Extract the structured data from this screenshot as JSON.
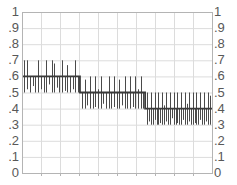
{
  "chart_data": {
    "type": "line",
    "title": "",
    "subtitle": "",
    "xlabel": "",
    "ylabel": "",
    "grid": true,
    "legend": null,
    "ylim": [
      0,
      1
    ],
    "xlim": [
      0,
      1
    ],
    "y_tick_labels": [
      "1",
      ".9",
      ".8",
      ".7",
      ".6",
      ".5",
      ".4",
      ".3",
      ".2",
      ".1",
      "0"
    ],
    "y_tick_values": [
      1,
      0.9,
      0.8,
      0.7,
      0.6,
      0.5,
      0.4,
      0.3,
      0.2,
      0.1,
      0
    ],
    "y_axis_right_tick_labels": [
      "1",
      ".9",
      ".8",
      ".7",
      ".6",
      ".5",
      ".4",
      ".3",
      ".2",
      ".1",
      "0"
    ],
    "x_tick_labels": [],
    "x_gridline_count": 9,
    "series": [
      {
        "name": "step-baseline",
        "type": "step",
        "color": "#3a3a3a",
        "segments": [
          {
            "x_start": 0.0,
            "x_end": 0.305,
            "value": 0.6
          },
          {
            "x_start": 0.305,
            "x_end": 0.648,
            "value": 0.5
          },
          {
            "x_start": 0.648,
            "x_end": 1.0,
            "value": 0.4
          }
        ]
      },
      {
        "name": "noise-spikes",
        "type": "vertical-lines",
        "color": "#4a4a4a",
        "description": "Vertical spike lines deviating about the step baseline by plus or minus 0.1",
        "spikes": [
          {
            "x": 0.012,
            "low": 0.5,
            "high": 0.7
          },
          {
            "x": 0.028,
            "low": 0.52,
            "high": 0.7
          },
          {
            "x": 0.04,
            "low": 0.5,
            "high": 0.6
          },
          {
            "x": 0.056,
            "low": 0.54,
            "high": 0.6
          },
          {
            "x": 0.07,
            "low": 0.5,
            "high": 0.6
          },
          {
            "x": 0.086,
            "low": 0.5,
            "high": 0.7
          },
          {
            "x": 0.1,
            "low": 0.52,
            "high": 0.6
          },
          {
            "x": 0.114,
            "low": 0.5,
            "high": 0.6
          },
          {
            "x": 0.128,
            "low": 0.5,
            "high": 0.7
          },
          {
            "x": 0.142,
            "low": 0.55,
            "high": 0.6
          },
          {
            "x": 0.156,
            "low": 0.5,
            "high": 0.7
          },
          {
            "x": 0.168,
            "low": 0.5,
            "high": 0.68
          },
          {
            "x": 0.182,
            "low": 0.53,
            "high": 0.6
          },
          {
            "x": 0.196,
            "low": 0.5,
            "high": 0.6
          },
          {
            "x": 0.21,
            "low": 0.5,
            "high": 0.7
          },
          {
            "x": 0.224,
            "low": 0.51,
            "high": 0.6
          },
          {
            "x": 0.238,
            "low": 0.5,
            "high": 0.67
          },
          {
            "x": 0.252,
            "low": 0.5,
            "high": 0.6
          },
          {
            "x": 0.266,
            "low": 0.52,
            "high": 0.6
          },
          {
            "x": 0.28,
            "low": 0.5,
            "high": 0.7
          },
          {
            "x": 0.294,
            "low": 0.5,
            "high": 0.6
          },
          {
            "x": 0.316,
            "low": 0.4,
            "high": 0.5
          },
          {
            "x": 0.33,
            "low": 0.4,
            "high": 0.58
          },
          {
            "x": 0.344,
            "low": 0.42,
            "high": 0.5
          },
          {
            "x": 0.358,
            "low": 0.4,
            "high": 0.6
          },
          {
            "x": 0.372,
            "low": 0.4,
            "high": 0.5
          },
          {
            "x": 0.386,
            "low": 0.41,
            "high": 0.6
          },
          {
            "x": 0.4,
            "low": 0.4,
            "high": 0.52
          },
          {
            "x": 0.414,
            "low": 0.4,
            "high": 0.6
          },
          {
            "x": 0.428,
            "low": 0.43,
            "high": 0.5
          },
          {
            "x": 0.442,
            "low": 0.4,
            "high": 0.5
          },
          {
            "x": 0.456,
            "low": 0.4,
            "high": 0.6
          },
          {
            "x": 0.47,
            "low": 0.4,
            "high": 0.5
          },
          {
            "x": 0.484,
            "low": 0.41,
            "high": 0.6
          },
          {
            "x": 0.498,
            "low": 0.4,
            "high": 0.5
          },
          {
            "x": 0.512,
            "low": 0.4,
            "high": 0.58
          },
          {
            "x": 0.526,
            "low": 0.42,
            "high": 0.5
          },
          {
            "x": 0.54,
            "low": 0.4,
            "high": 0.6
          },
          {
            "x": 0.554,
            "low": 0.4,
            "high": 0.5
          },
          {
            "x": 0.568,
            "low": 0.4,
            "high": 0.6
          },
          {
            "x": 0.582,
            "low": 0.41,
            "high": 0.5
          },
          {
            "x": 0.596,
            "low": 0.4,
            "high": 0.6
          },
          {
            "x": 0.61,
            "low": 0.4,
            "high": 0.52
          },
          {
            "x": 0.624,
            "low": 0.4,
            "high": 0.6
          },
          {
            "x": 0.638,
            "low": 0.4,
            "high": 0.5
          },
          {
            "x": 0.658,
            "low": 0.3,
            "high": 0.5
          },
          {
            "x": 0.668,
            "low": 0.32,
            "high": 0.4
          },
          {
            "x": 0.678,
            "low": 0.3,
            "high": 0.5
          },
          {
            "x": 0.688,
            "low": 0.3,
            "high": 0.4
          },
          {
            "x": 0.698,
            "low": 0.33,
            "high": 0.5
          },
          {
            "x": 0.708,
            "low": 0.3,
            "high": 0.4
          },
          {
            "x": 0.718,
            "low": 0.3,
            "high": 0.5
          },
          {
            "x": 0.728,
            "low": 0.31,
            "high": 0.4
          },
          {
            "x": 0.738,
            "low": 0.3,
            "high": 0.5
          },
          {
            "x": 0.748,
            "low": 0.3,
            "high": 0.42
          },
          {
            "x": 0.758,
            "low": 0.32,
            "high": 0.5
          },
          {
            "x": 0.768,
            "low": 0.3,
            "high": 0.4
          },
          {
            "x": 0.778,
            "low": 0.3,
            "high": 0.5
          },
          {
            "x": 0.788,
            "low": 0.34,
            "high": 0.4
          },
          {
            "x": 0.798,
            "low": 0.3,
            "high": 0.5
          },
          {
            "x": 0.808,
            "low": 0.3,
            "high": 0.4
          },
          {
            "x": 0.818,
            "low": 0.31,
            "high": 0.5
          },
          {
            "x": 0.828,
            "low": 0.3,
            "high": 0.4
          },
          {
            "x": 0.838,
            "low": 0.3,
            "high": 0.5
          },
          {
            "x": 0.848,
            "low": 0.33,
            "high": 0.4
          },
          {
            "x": 0.858,
            "low": 0.3,
            "high": 0.5
          },
          {
            "x": 0.868,
            "low": 0.3,
            "high": 0.43
          },
          {
            "x": 0.878,
            "low": 0.32,
            "high": 0.5
          },
          {
            "x": 0.888,
            "low": 0.3,
            "high": 0.4
          },
          {
            "x": 0.898,
            "low": 0.3,
            "high": 0.5
          },
          {
            "x": 0.908,
            "low": 0.31,
            "high": 0.4
          },
          {
            "x": 0.918,
            "low": 0.3,
            "high": 0.5
          },
          {
            "x": 0.928,
            "low": 0.3,
            "high": 0.4
          },
          {
            "x": 0.938,
            "low": 0.33,
            "high": 0.5
          },
          {
            "x": 0.948,
            "low": 0.3,
            "high": 0.4
          },
          {
            "x": 0.958,
            "low": 0.3,
            "high": 0.5
          },
          {
            "x": 0.968,
            "low": 0.32,
            "high": 0.4
          },
          {
            "x": 0.978,
            "low": 0.3,
            "high": 0.5
          },
          {
            "x": 0.988,
            "low": 0.3,
            "high": 0.48
          }
        ]
      }
    ]
  },
  "style": {
    "axis_color": "#b4b4b4",
    "grid_color": "#dcdcdc",
    "tick_text_color": "#585858",
    "data_color": "#3a3a3a",
    "spike_color": "#4a4a4a",
    "background": "#ffffff"
  },
  "geometry": {
    "plot_left": 22,
    "plot_top": 12,
    "plot_right": 212,
    "plot_bottom": 173
  }
}
